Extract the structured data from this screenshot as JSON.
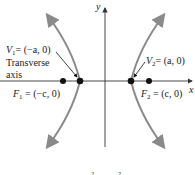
{
  "diagram": {
    "type": "hyperbola",
    "orientation": "horizontal transverse axis",
    "axes": {
      "x_label": "x",
      "y_label": "y"
    },
    "vertices": [
      {
        "name": "V1",
        "label_main": "V",
        "label_sub": "1",
        "label_rest": "= (−a, 0)",
        "coord": "(−a, 0)"
      },
      {
        "name": "V2",
        "label_main": "V",
        "label_sub": "2",
        "label_rest": "= (a, 0)",
        "coord": "(a, 0)"
      }
    ],
    "foci": [
      {
        "name": "F1",
        "label_main": "F",
        "label_sub": "1",
        "label_rest": " = (−c, 0)",
        "coord": "(−c, 0)"
      },
      {
        "name": "F2",
        "label_main": "F",
        "label_sub": "2",
        "label_rest": " = (c, 0)",
        "coord": "(c, 0)"
      }
    ],
    "annotation": {
      "line1": "Transverse",
      "line2": "axis"
    },
    "equation_fragment": {
      "sup1": "2",
      "sup2": "2"
    },
    "colors": {
      "curve": "#8a8a8a",
      "axis": "#333333",
      "point": "#111111"
    }
  }
}
